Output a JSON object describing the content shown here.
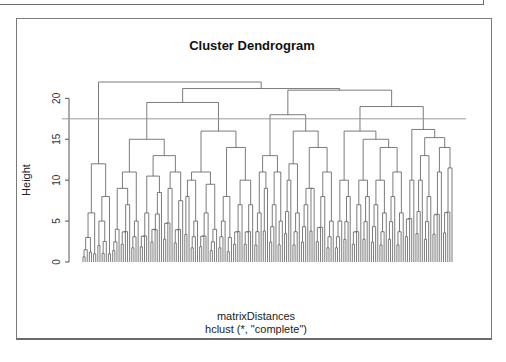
{
  "chart_data": {
    "type": "dendrogram",
    "title": "Cluster Dendrogram",
    "xlabel": "matrixDistances",
    "sublabel": "hclust (*, \"complete\")",
    "ylabel": "Height",
    "ylim": [
      0,
      22
    ],
    "yticks": [
      0,
      5,
      10,
      15,
      20
    ],
    "cut_height": 17.5,
    "colors": {
      "branch": "#5a5a5a",
      "cut_line": "#9a9a9a",
      "axis": "#555555"
    },
    "tree": {
      "h": 22.0,
      "c": [
        {
          "h": 12.0,
          "c": [
            {
              "h": 6.0,
              "c": [
                {
                  "h": 3.0,
                  "c": [
                    {
                      "h": 1.5,
                      "n": 3
                    },
                    {
                      "h": 1.2,
                      "n": 2
                    }
                  ]
                },
                {
                  "h": 1.0,
                  "n": 2
                }
              ]
            },
            {
              "h": 8.0,
              "c": [
                {
                  "h": 5.0,
                  "c": [
                    {
                      "h": 2.0,
                      "n": 2
                    },
                    {
                      "h": 2.5,
                      "n": 3
                    }
                  ]
                },
                {
                  "h": 1.0,
                  "n": 2
                }
              ]
            }
          ]
        },
        {
          "h": 21.2,
          "c": [
            {
              "h": 19.5,
              "c": [
                {
                  "h": 15.0,
                  "c": [
                    {
                      "h": 11.0,
                      "c": [
                        {
                          "h": 9.0,
                          "c": [
                            {
                              "h": 4.0,
                              "n": 4
                            },
                            {
                              "h": 7.0,
                              "n": 5
                            }
                          ]
                        },
                        {
                          "h": 5.0,
                          "n": 4
                        }
                      ]
                    },
                    {
                      "h": 13.0,
                      "c": [
                        {
                          "h": 10.5,
                          "c": [
                            {
                              "h": 6.0,
                              "n": 5
                            },
                            {
                              "h": 8.5,
                              "n": 6
                            }
                          ]
                        },
                        {
                          "h": 11.0,
                          "c": [
                            {
                              "h": 9.0,
                              "n": 5
                            },
                            {
                              "h": 7.5,
                              "n": 5
                            }
                          ]
                        }
                      ]
                    }
                  ]
                },
                {
                  "h": 16.0,
                  "c": [
                    {
                      "h": 11.0,
                      "c": [
                        {
                          "h": 10.0,
                          "c": [
                            {
                              "h": 8.0,
                              "n": 3
                            },
                            {
                              "h": 5.0,
                              "n": 4
                            }
                          ]
                        },
                        {
                          "h": 9.5,
                          "c": [
                            {
                              "h": 6.0,
                              "n": 5
                            },
                            {
                              "h": 4.0,
                              "n": 4
                            }
                          ]
                        }
                      ]
                    },
                    {
                      "h": 14.0,
                      "c": [
                        {
                          "h": 8.0,
                          "c": [
                            {
                              "h": 5.0,
                              "n": 4
                            },
                            {
                              "h": 3.0,
                              "n": 3
                            }
                          ]
                        },
                        {
                          "h": 10.0,
                          "c": [
                            {
                              "h": 7.0,
                              "n": 5
                            },
                            {
                              "h": 7.0,
                              "n": 5
                            }
                          ]
                        }
                      ]
                    }
                  ]
                }
              ]
            },
            {
              "h": 21.0,
              "c": [
                {
                  "h": 18.0,
                  "c": [
                    {
                      "h": 13.0,
                      "c": [
                        {
                          "h": 11.0,
                          "c": [
                            {
                              "h": 6.0,
                              "n": 4
                            },
                            {
                              "h": 9.0,
                              "n": 3
                            }
                          ]
                        },
                        {
                          "h": 11.0,
                          "c": [
                            {
                              "h": 7.0,
                              "n": 4
                            },
                            {
                              "h": 5.0,
                              "n": 3
                            }
                          ]
                        }
                      ]
                    },
                    {
                      "h": 16.0,
                      "c": [
                        {
                          "h": 12.0,
                          "c": [
                            {
                              "h": 10.0,
                              "n": 4
                            },
                            {
                              "h": 6.0,
                              "n": 4
                            }
                          ]
                        },
                        {
                          "h": 14.0,
                          "c": [
                            {
                              "h": 9.0,
                              "c": [
                                {
                                  "h": 7.0,
                                  "n": 4
                                },
                                {
                                  "h": 9.0,
                                  "n": 3
                                }
                              ]
                            },
                            {
                              "h": 11.0,
                              "c": [
                                {
                                  "h": 8.0,
                                  "n": 5
                                },
                                {
                                  "h": 5.0,
                                  "n": 4
                                }
                              ]
                            }
                          ]
                        }
                      ]
                    }
                  ]
                },
                {
                  "h": 19.0,
                  "c": [
                    {
                      "h": 16.0,
                      "c": [
                        {
                          "h": 10.0,
                          "c": [
                            {
                              "h": 5.0,
                              "n": 4
                            },
                            {
                              "h": 8.0,
                              "n": 4
                            }
                          ]
                        },
                        {
                          "h": 15.0,
                          "c": [
                            {
                              "h": 10.0,
                              "c": [
                                {
                                  "h": 7.0,
                                  "n": 5
                                },
                                {
                                  "h": 8.0,
                                  "n": 4
                                }
                              ]
                            },
                            {
                              "h": 14.0,
                              "c": [
                                {
                                  "h": 10.0,
                                  "c": [
                                    {
                                      "h": 7.0,
                                      "n": 4
                                    },
                                    {
                                      "h": 6.0,
                                      "n": 4
                                    }
                                  ]
                                },
                                {
                                  "h": 11.0,
                                  "c": [
                                    {
                                      "h": 8.0,
                                      "n": 4
                                    },
                                    {
                                      "h": 6.0,
                                      "n": 4
                                    }
                                  ]
                                }
                              ]
                            }
                          ]
                        }
                      ]
                    },
                    {
                      "h": 16.2,
                      "c": [
                        {
                          "h": 10.0,
                          "n": 5
                        },
                        {
                          "h": 15.2,
                          "c": [
                            {
                              "h": 13.0,
                              "c": [
                                {
                                  "h": 10.0,
                                  "n": 4
                                },
                                {
                                  "h": 8.0,
                                  "n": 4
                                }
                              ]
                            },
                            {
                              "h": 14.0,
                              "c": [
                                {
                                  "h": 11.0,
                                  "n": 5
                                },
                                {
                                  "h": 11.5,
                                  "n": 5
                                }
                              ]
                            }
                          ]
                        }
                      ]
                    }
                  ]
                }
              ]
            }
          ]
        }
      ]
    }
  }
}
